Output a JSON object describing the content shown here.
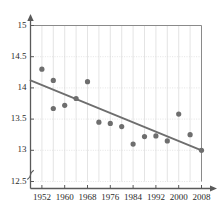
{
  "chart_data": {
    "type": "scatter",
    "title": "",
    "subtitle": "",
    "xlabel": "",
    "ylabel": "",
    "xlim": [
      1948,
      2008
    ],
    "ylim": [
      12.5,
      15
    ],
    "y_axis_break": true,
    "grid": true,
    "legend": null,
    "yticks": [
      12.5,
      13,
      13.5,
      14,
      14.5,
      15
    ],
    "ytick_labels": [
      "12.5",
      "13",
      "13.5",
      "14",
      "14.5",
      "15"
    ],
    "xticks": [
      1952,
      1960,
      1968,
      1976,
      1984,
      1992,
      2000,
      2008
    ],
    "xtick_labels": [
      "1952",
      "1960",
      "1968",
      "1976",
      "1984",
      "1992",
      "2000",
      "2008"
    ],
    "x_minor_gridline_step": 4,
    "point_color": "#6e6e6e",
    "line_color": "#6e6e6e",
    "axis_color": "#5a5a5a",
    "grid_color": "#d8d8d8",
    "text_color": "#2b2b2b",
    "point_radius": 2.6,
    "points": [
      {
        "x": 1952,
        "y": 14.3
      },
      {
        "x": 1956,
        "y": 14.12
      },
      {
        "x": 1956,
        "y": 13.67
      },
      {
        "x": 1960,
        "y": 13.72
      },
      {
        "x": 1964,
        "y": 13.83
      },
      {
        "x": 1968,
        "y": 14.1
      },
      {
        "x": 1972,
        "y": 13.45
      },
      {
        "x": 1976,
        "y": 13.43
      },
      {
        "x": 1980,
        "y": 13.38
      },
      {
        "x": 1984,
        "y": 13.1
      },
      {
        "x": 1988,
        "y": 13.22
      },
      {
        "x": 1992,
        "y": 13.23
      },
      {
        "x": 1996,
        "y": 13.15
      },
      {
        "x": 2000,
        "y": 13.58
      },
      {
        "x": 2004,
        "y": 13.25
      },
      {
        "x": 2008,
        "y": 13.0
      }
    ],
    "trendline": {
      "x0": 1948,
      "y0": 14.12,
      "x1": 2008,
      "y1": 13.0
    }
  }
}
